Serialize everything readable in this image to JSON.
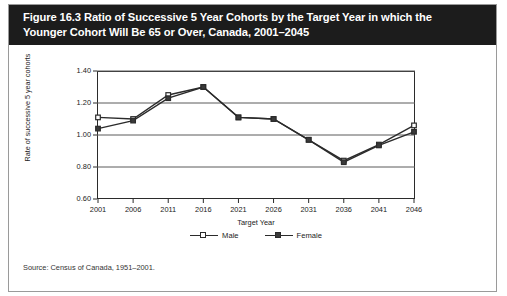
{
  "figure": {
    "title_lines": [
      "Figure 16.3 Ratio of Successive 5 Year Cohorts by the Target Year in which the",
      "Younger Cohort Will Be 65 or Over, Canada, 2001–2045"
    ],
    "source": "Source: Census of Canada, 1951–2001."
  },
  "colors": {
    "banner_bg": "#1c1c1c",
    "banner_text": "#ffffff",
    "axis": "#2b2b2b",
    "gridline": "#5a5a5a",
    "male_marker_fill": "#ffffff",
    "female_marker_fill": "#3a3a3a",
    "line": "#2b2b2b",
    "page_bg": "#ffffff",
    "border": "#9a9a9a"
  },
  "chart_data": {
    "type": "line",
    "title": "Figure 16.3 Ratio of Successive 5 Year Cohorts by the Target Year in which the Younger Cohort Will Be 65 or Over, Canada, 2001–2045",
    "xlabel": "Target Year",
    "ylabel": "Rate of successive 5 year cohorts",
    "categories": [
      "2001",
      "2006",
      "2011",
      "2016",
      "2021",
      "2026",
      "2031",
      "2036",
      "2041",
      "2046"
    ],
    "x": [
      2001,
      2006,
      2011,
      2016,
      2021,
      2026,
      2031,
      2036,
      2041,
      2046
    ],
    "series": [
      {
        "name": "Male",
        "marker": "open-square",
        "values": [
          1.11,
          1.1,
          1.25,
          1.3,
          1.11,
          1.1,
          0.97,
          0.84,
          0.94,
          1.06
        ]
      },
      {
        "name": "Female",
        "marker": "filled-square",
        "values": [
          1.04,
          1.09,
          1.23,
          1.3,
          1.11,
          1.1,
          0.97,
          0.83,
          0.935,
          1.02
        ]
      }
    ],
    "ylim": [
      0.6,
      1.4
    ],
    "yticks": [
      0.6,
      0.8,
      1.0,
      1.2,
      1.4
    ],
    "ytick_labels": [
      "0.60",
      "0.80",
      "1.00",
      "1.20",
      "1.40"
    ],
    "xlim": [
      2001,
      2046
    ],
    "grid": true,
    "grid_axis": "y",
    "legend_position": "bottom-center",
    "legend_entries": [
      "Male",
      "Female"
    ]
  }
}
